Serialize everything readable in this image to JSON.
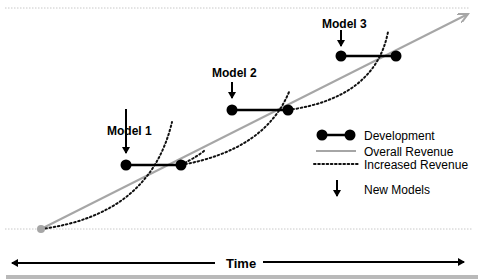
{
  "models": [
    {
      "label": "Model 1"
    },
    {
      "label": "Model 2"
    },
    {
      "label": "Model 3"
    }
  ],
  "legend": {
    "development": "Development",
    "overall_revenue": "Overall Revenue",
    "increased_revenue": "Increased Revenue",
    "new_models": "New Models"
  },
  "axis": {
    "time_label": "Time"
  },
  "colors": {
    "overall_revenue": "#a6a6a6",
    "development": "#000000",
    "increased_revenue": "#000000",
    "guide_lines": "#c8c8c8"
  }
}
